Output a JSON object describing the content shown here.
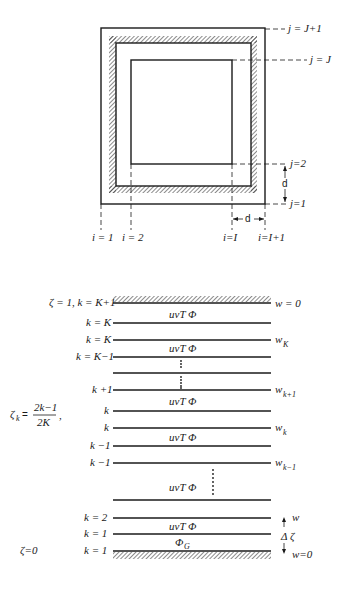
{
  "top_diagram": {
    "j_labels": [
      "j = J+1",
      "j = J",
      "j=2",
      "j=1"
    ],
    "i_labels": [
      "i = 1",
      "i = 2",
      "i=I",
      "i=I+1"
    ],
    "spacing_label": "d",
    "spacing_label_horizontal": "d"
  },
  "bottom_diagram": {
    "top_label": "ζ = 1, k = K+1",
    "top_w_label": "w = 0",
    "zeta_formula_lhs": "ζ",
    "zeta_formula_sub": "k",
    "zeta_formula_num": "2k−1",
    "zeta_formula_den": "2K",
    "zeta_bottom_label": "ζ=0",
    "bottom_w_label": "w=0",
    "w_arrow_label": "w",
    "delta_zeta_label": "Δ ζ",
    "layer_text": "uvT Φ",
    "ground_text": "Φ",
    "ground_sub": "G",
    "levels": [
      {
        "label": "k = K",
        "w": ""
      },
      {
        "label": "k = K",
        "w": "w",
        "w_sub": "K"
      },
      {
        "label": "k = K−1",
        "w": ""
      },
      {
        "label": "",
        "w": ""
      },
      {
        "label": "k +1",
        "w": "w",
        "w_sub": "k+1"
      },
      {
        "label": "k",
        "w": ""
      },
      {
        "label": "k",
        "w": "w",
        "w_sub": "k"
      },
      {
        "label": "k −1",
        "w": ""
      },
      {
        "label": "k −1",
        "w": "w",
        "w_sub": "k−1"
      },
      {
        "label": "",
        "w": ""
      },
      {
        "label": "k = 2",
        "w": ""
      },
      {
        "label": "k = 1",
        "w": ""
      },
      {
        "label": "k = 1",
        "w": ""
      }
    ]
  }
}
